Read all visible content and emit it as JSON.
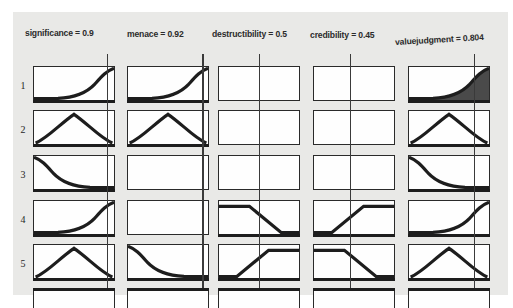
{
  "viewer": {
    "title": "fuzzy-rule-viewer",
    "background_color": "#e9e9e7",
    "ink_color": "#1d1d1d",
    "fill_color": "#4a4a4a"
  },
  "columns": [
    {
      "id": "significance",
      "label": "significance = 0.9",
      "variable": "significance",
      "value": "0.9",
      "value_num": 0.9,
      "kind": "input",
      "marker_pos": 0.9
    },
    {
      "id": "menace",
      "label": "menace = 0.92",
      "variable": "menace",
      "value": "0.92",
      "value_num": 0.92,
      "kind": "input",
      "marker_pos": 0.92
    },
    {
      "id": "destructibility",
      "label": "destructibility = 0.5",
      "variable": "destructibility",
      "value": "0.5",
      "value_num": 0.5,
      "kind": "input",
      "marker_pos": 0.5
    },
    {
      "id": "credibility",
      "label": "credibility = 0.45",
      "variable": "credibility",
      "value": "0.45",
      "value_num": 0.45,
      "kind": "input",
      "marker_pos": 0.45
    },
    {
      "id": "valuejudgment",
      "label": "valuejudgment = 0.804",
      "variable": "valuejudgment",
      "value": "0.804",
      "value_num": 0.804,
      "kind": "output",
      "marker_pos": 0.804
    }
  ],
  "rows": [
    {
      "index": "1"
    },
    {
      "index": "2"
    },
    {
      "index": "3"
    },
    {
      "index": "4"
    },
    {
      "index": "5"
    }
  ],
  "partial_row": {
    "index": "6",
    "clipped": true
  },
  "cells": [
    [
      {
        "shape": "s-rise",
        "filled": false,
        "empty": false
      },
      {
        "shape": "s-rise",
        "filled": false,
        "empty": false
      },
      {
        "shape": "empty",
        "filled": false,
        "empty": true
      },
      {
        "shape": "empty",
        "filled": false,
        "empty": true
      },
      {
        "shape": "s-rise",
        "filled": true,
        "empty": false
      }
    ],
    [
      {
        "shape": "triangle",
        "filled": false,
        "empty": false
      },
      {
        "shape": "triangle",
        "filled": false,
        "empty": false
      },
      {
        "shape": "empty",
        "filled": false,
        "empty": true
      },
      {
        "shape": "empty",
        "filled": false,
        "empty": true
      },
      {
        "shape": "triangle",
        "filled": false,
        "empty": false
      }
    ],
    [
      {
        "shape": "s-fall",
        "filled": false,
        "empty": false
      },
      {
        "shape": "empty",
        "filled": false,
        "empty": true
      },
      {
        "shape": "empty",
        "filled": false,
        "empty": true
      },
      {
        "shape": "empty",
        "filled": false,
        "empty": true
      },
      {
        "shape": "s-fall",
        "filled": false,
        "empty": false
      }
    ],
    [
      {
        "shape": "s-rise",
        "filled": false,
        "empty": false
      },
      {
        "shape": "empty",
        "filled": false,
        "empty": true
      },
      {
        "shape": "ramp-down",
        "filled": false,
        "empty": false
      },
      {
        "shape": "ramp-up",
        "filled": false,
        "empty": false
      },
      {
        "shape": "s-rise",
        "filled": false,
        "empty": false
      }
    ],
    [
      {
        "shape": "triangle",
        "filled": false,
        "empty": false
      },
      {
        "shape": "s-fall",
        "filled": false,
        "empty": false
      },
      {
        "shape": "ramp-up",
        "filled": false,
        "empty": false
      },
      {
        "shape": "ramp-down",
        "filled": false,
        "empty": false
      },
      {
        "shape": "triangle",
        "filled": false,
        "empty": false
      }
    ]
  ]
}
